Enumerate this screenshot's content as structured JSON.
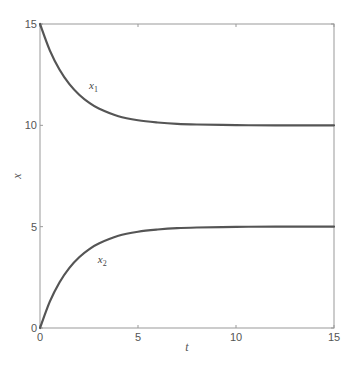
{
  "chart_data": {
    "type": "line",
    "title": "",
    "xlabel": "t",
    "ylabel": "x",
    "xlim": [
      0,
      15
    ],
    "ylim": [
      0,
      15
    ],
    "xticks": [
      0,
      5,
      10,
      15
    ],
    "yticks": [
      0,
      5,
      10,
      15
    ],
    "grid": false,
    "legend": "none (inline curve labels)",
    "x": [
      0,
      0.5,
      1,
      1.5,
      2,
      2.5,
      3,
      4,
      5,
      6,
      7,
      8,
      10,
      12,
      15
    ],
    "series": [
      {
        "name": "x1",
        "label_base": "x",
        "label_sub": "1",
        "label_pos": [
          2.5,
          11.8
        ],
        "color": "#555555",
        "values": [
          15,
          13.7,
          12.74,
          12.03,
          11.51,
          11.12,
          10.83,
          10.45,
          10.25,
          10.14,
          10.07,
          10.04,
          10.01,
          10.0,
          10.0
        ]
      },
      {
        "name": "x2",
        "label_base": "x",
        "label_sub": "2",
        "label_pos": [
          2.95,
          3.2
        ],
        "color": "#555555",
        "values": [
          0,
          1.3,
          2.26,
          2.97,
          3.49,
          3.88,
          4.17,
          4.55,
          4.75,
          4.86,
          4.93,
          4.96,
          4.99,
          5.0,
          5.0
        ]
      }
    ]
  },
  "colors": {
    "axis": "#888888",
    "curve": "#555555",
    "text": "#555555"
  }
}
